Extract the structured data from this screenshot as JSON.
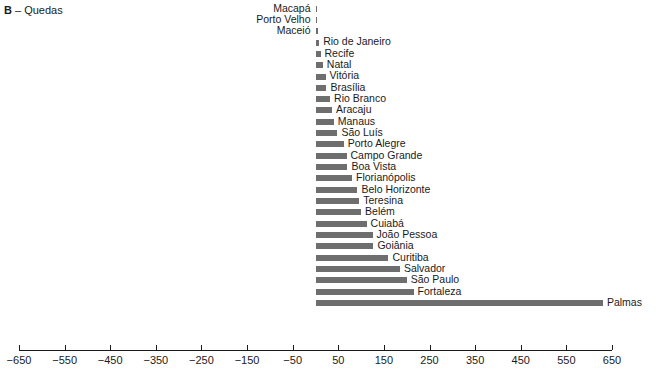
{
  "panel": {
    "tag": "B",
    "dash": " – ",
    "title": "Quedas"
  },
  "chart_data": {
    "type": "bar",
    "orientation": "horizontal",
    "title": "B – Quedas",
    "xlabel": "",
    "ylabel": "",
    "xlim": [
      -650,
      650
    ],
    "xticks": [
      -650,
      -550,
      -450,
      -350,
      -250,
      -150,
      -50,
      50,
      150,
      250,
      350,
      450,
      550,
      650
    ],
    "xtick_labels": [
      "−650",
      "−550",
      "−450",
      "−350",
      "−250",
      "−150",
      "−50",
      "50",
      "150",
      "250",
      "350",
      "450",
      "550",
      "650"
    ],
    "grid": false,
    "legend": "none",
    "bar_color": "#6e6e6e",
    "categories": [
      "Macapá",
      "Porto Velho",
      "Maceió",
      "Rio de Janeiro",
      "Recife",
      "Natal",
      "Vitória",
      "Brasília",
      "Rio Branco",
      "Aracaju",
      "Manaus",
      "São Luís",
      "Porto Alegre",
      "Campo Grande",
      "Boa Vista",
      "Florianópolis",
      "Belo Horizonte",
      "Teresina",
      "Belém",
      "Cuiabá",
      "João Pessoa",
      "Goiânia",
      "Curitiba",
      "Salvador",
      "São Paulo",
      "Fortaleza",
      "Palmas"
    ],
    "values": [
      4,
      4,
      5,
      8,
      11,
      16,
      22,
      24,
      32,
      36,
      40,
      48,
      62,
      68,
      70,
      80,
      92,
      96,
      100,
      112,
      125,
      127,
      160,
      185,
      200,
      215,
      630
    ],
    "label_side": [
      "left",
      "left",
      "left",
      "right",
      "right",
      "right",
      "right",
      "right",
      "right",
      "right",
      "right",
      "right",
      "right",
      "right",
      "right",
      "right",
      "right",
      "right",
      "right",
      "right",
      "right",
      "right",
      "right",
      "right",
      "right",
      "right",
      "right"
    ]
  }
}
